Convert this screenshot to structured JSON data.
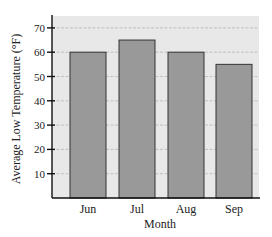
{
  "chart_data": {
    "type": "bar",
    "title": "",
    "xlabel": "Month",
    "ylabel": "Average Low Temperature (°F)",
    "categories": [
      "Jun",
      "Jul",
      "Aug",
      "Sep"
    ],
    "values": [
      60,
      65,
      60,
      55
    ],
    "ylim": [
      0,
      75
    ],
    "yticks": [
      10,
      20,
      30,
      40,
      50,
      60,
      70
    ],
    "grid": true,
    "legend": null,
    "colors": {
      "bar": "#999999",
      "bar_edge": "#333333",
      "plot_bg": "#e8e8e8",
      "grid": "#b8b8b8"
    }
  }
}
